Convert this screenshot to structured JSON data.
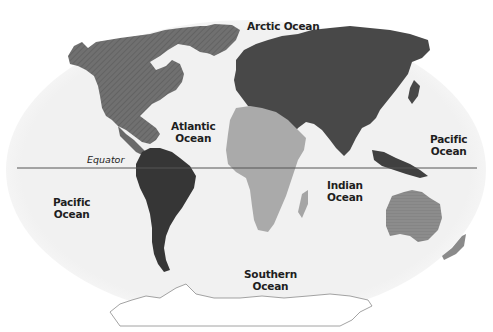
{
  "map": {
    "title": "World oceans and continents",
    "labels": {
      "arctic": "Arctic Ocean",
      "atlantic_1": "Atlantic",
      "atlantic_2": "Ocean",
      "pacific_east_1": "Pacific",
      "pacific_east_2": "Ocean",
      "pacific_west_1": "Pacific",
      "pacific_west_2": "Ocean",
      "indian_1": "Indian",
      "indian_2": "Ocean",
      "southern_1": "Southern",
      "southern_2": "Ocean",
      "equator": "Equator"
    },
    "colors": {
      "ocean": "#f2f2f2",
      "north_america": "#6e6e6e",
      "south_america": "#383838",
      "eurasia": "#4a4a4a",
      "africa": "#a9a9a9",
      "australia": "#8a8a8a",
      "antarctica": "#ffffff",
      "equator_line": "#555555"
    }
  }
}
